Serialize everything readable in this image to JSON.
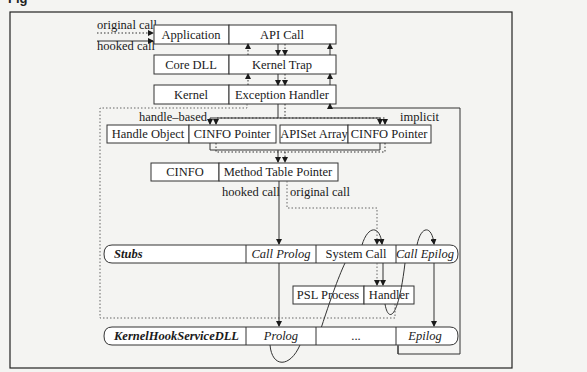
{
  "caption": "Fig",
  "labels": {
    "original_call_top": "original call",
    "hooked_call_top": "hooked call",
    "handle_based": "handle–based",
    "implicit": "implicit",
    "hooked_call_mid": "hooked call",
    "original_call_mid": "original call"
  },
  "boxes": {
    "application": "Application",
    "api_call": "API Call",
    "core_dll": "Core DLL",
    "kernel_trap": "Kernel Trap",
    "kernel": "Kernel",
    "exception_handler": "Exception Handler",
    "handle_object": "Handle Object",
    "cinfo_pointer_1": "CINFO Pointer",
    "apiset_array": "APISet Array",
    "cinfo_pointer_2": "CINFO Pointer",
    "cinfo": "CINFO",
    "method_table_pointer": "Method Table Pointer",
    "stubs": "Stubs",
    "call_prolog": "Call Prolog",
    "system_call": "System Call",
    "call_epilog": "Call Epilog",
    "psl_process": "PSL Process",
    "handler": "Handler",
    "kernel_hook_service_dll": "KernelHookServiceDLL",
    "prolog": "Prolog",
    "ellipsis": "...",
    "epilog": "Epilog"
  }
}
